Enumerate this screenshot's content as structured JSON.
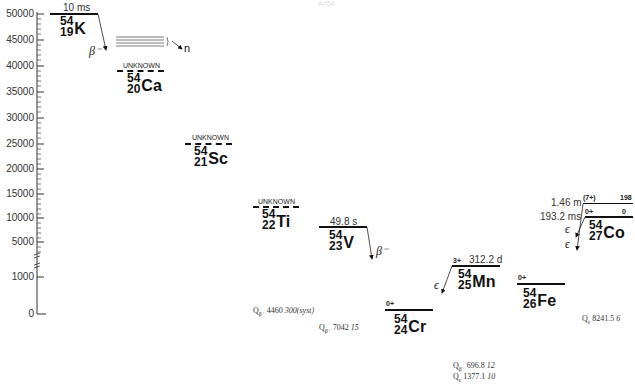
{
  "title": "A=54",
  "axis": {
    "ticks": [
      {
        "label": "50000",
        "y": 14
      },
      {
        "label": "45000",
        "y": 40
      },
      {
        "label": "40000",
        "y": 66
      },
      {
        "label": "35000",
        "y": 92
      },
      {
        "label": "30000",
        "y": 118
      },
      {
        "label": "25000",
        "y": 144
      },
      {
        "label": "20000",
        "y": 169
      },
      {
        "label": "15000",
        "y": 194
      },
      {
        "label": "10000",
        "y": 218
      },
      {
        "label": "5000",
        "y": 242
      },
      {
        "label": "1000",
        "y": 277
      },
      {
        "label": "0",
        "y": 314
      }
    ]
  },
  "nuclides": [
    {
      "id": "K",
      "mass": "54",
      "z": "19",
      "symbol": "K",
      "halflife": "10 ms",
      "status": ""
    },
    {
      "id": "Ca",
      "mass": "54",
      "z": "20",
      "symbol": "Ca",
      "halflife": "",
      "status": "UNKNOWN"
    },
    {
      "id": "Sc",
      "mass": "54",
      "z": "21",
      "symbol": "Sc",
      "halflife": "",
      "status": "UNKNOWN"
    },
    {
      "id": "Ti",
      "mass": "54",
      "z": "22",
      "symbol": "Ti",
      "halflife": "",
      "status": "UNKNOWN"
    },
    {
      "id": "V",
      "mass": "54",
      "z": "23",
      "symbol": "V",
      "halflife": "49.8 s",
      "status": ""
    },
    {
      "id": "Cr",
      "mass": "54",
      "z": "24",
      "symbol": "Cr",
      "halflife": "",
      "spin": "0+"
    },
    {
      "id": "Mn",
      "mass": "54",
      "z": "25",
      "symbol": "Mn",
      "halflife": "312.2 d",
      "spin": "3+"
    },
    {
      "id": "Fe",
      "mass": "54",
      "z": "26",
      "symbol": "Fe",
      "halflife": "",
      "spin": "0+"
    },
    {
      "id": "Co",
      "mass": "54",
      "z": "27",
      "symbol": "Co",
      "levels": [
        {
          "spin": "(7+)",
          "energy": "198",
          "halflife": "1.46 m"
        },
        {
          "spin": "0+",
          "energy": "0",
          "halflife": "193.2 ms"
        }
      ]
    }
  ],
  "decays": {
    "K_beta": "β⁻",
    "K_neutron": "n",
    "V_beta": "β⁻",
    "Mn_ec": "ϵ",
    "Co_ec1": "ϵ",
    "Co_ec2": "ϵ"
  },
  "qvalues": {
    "Ti": {
      "label": "Q",
      "sub": "β⁻",
      "value": "4460",
      "unc": "300(syst)"
    },
    "V": {
      "label": "Q",
      "sub": "β⁻",
      "value": "7042",
      "unc": "15"
    },
    "Mn_beta": {
      "label": "Q",
      "sub": "β⁻",
      "value": "696.8",
      "unc": "12"
    },
    "Mn_ec": {
      "label": "Q",
      "sub": "ε",
      "value": "1377.1",
      "unc": "10"
    },
    "Co": {
      "label": "Q",
      "sub": "ε",
      "value": "8241.5",
      "unc": "6"
    }
  }
}
